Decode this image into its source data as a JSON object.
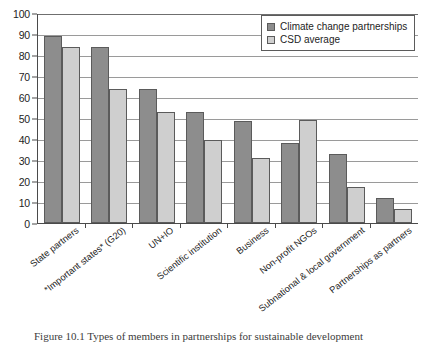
{
  "chart_data": {
    "type": "bar",
    "title": "",
    "xlabel": "",
    "ylabel": "",
    "ylim": [
      0,
      100
    ],
    "yticks": [
      0,
      10,
      20,
      30,
      40,
      50,
      60,
      70,
      80,
      90,
      100
    ],
    "grid": true,
    "legend_position": "top-right",
    "categories": [
      "State partners",
      "*Important states* (G20)",
      "UN+IO",
      "Scientific institution",
      "Business",
      "Non-profit NGOs",
      "Subnational & local government",
      "Partnerships as partners"
    ],
    "series": [
      {
        "name": "Climate change partnerships",
        "color": "#8d8d8d",
        "values": [
          89,
          84,
          64,
          53,
          48.5,
          38,
          33,
          12
        ]
      },
      {
        "name": "CSD average",
        "color": "#cfcfcf",
        "values": [
          84,
          64,
          53,
          39.5,
          31,
          49,
          17,
          6.5
        ]
      }
    ]
  },
  "legend": {
    "items": [
      {
        "label": "Climate change partnerships"
      },
      {
        "label": "CSD average"
      }
    ]
  },
  "caption": {
    "text": "Figure 10.1  Types of members in partnerships for sustainable development"
  }
}
